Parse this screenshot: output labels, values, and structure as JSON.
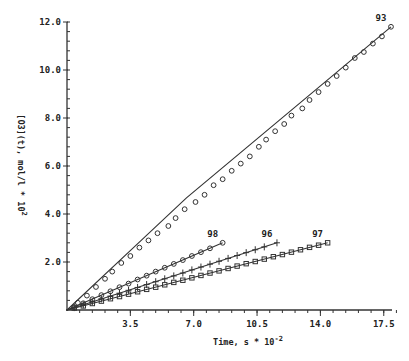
{
  "chart_data": {
    "type": "scatter",
    "title": "",
    "xlabel": "Time, s * 10",
    "xlabel_exponent": "-2",
    "ylabel": "[O3](t), mol/l * 10",
    "ylabel_exponent": "2",
    "xlim": [
      0,
      18.2
    ],
    "ylim": [
      0,
      12.0
    ],
    "x_ticks": [
      3.5,
      7.0,
      10.5,
      14.0,
      17.5
    ],
    "x_tick_labels": [
      "3.5",
      "7.0",
      "10.5",
      "14.0",
      "17.5"
    ],
    "x_minor_step": 0.7,
    "y_ticks": [
      2.0,
      4.0,
      6.0,
      8.0,
      10.0,
      12.0
    ],
    "y_tick_labels": [
      "2.0",
      "4.0",
      "6.0",
      "8.0",
      "10.0",
      "12.0"
    ],
    "y_minor_step": 0.4,
    "grid": false,
    "legend": "none (series labeled inline at line ends)",
    "series": [
      {
        "name": "93",
        "marker": "circle",
        "fit_line": [
          [
            0,
            0
          ],
          [
            4.1,
            2.9
          ],
          [
            6.6,
            4.67
          ],
          [
            17.9,
            11.8
          ]
        ],
        "points": [
          [
            0.6,
            0.3
          ],
          [
            1.1,
            0.6
          ],
          [
            1.6,
            0.96
          ],
          [
            2.1,
            1.3
          ],
          [
            2.5,
            1.6
          ],
          [
            3.0,
            1.96
          ],
          [
            3.5,
            2.25
          ],
          [
            4.0,
            2.6
          ],
          [
            4.5,
            2.9
          ],
          [
            5.0,
            3.2
          ],
          [
            5.6,
            3.5
          ],
          [
            6.0,
            3.83
          ],
          [
            6.5,
            4.2
          ],
          [
            7.1,
            4.5
          ],
          [
            7.6,
            4.8
          ],
          [
            8.1,
            5.2
          ],
          [
            8.6,
            5.45
          ],
          [
            9.1,
            5.8
          ],
          [
            9.6,
            6.1
          ],
          [
            10.1,
            6.4
          ],
          [
            10.6,
            6.8
          ],
          [
            11.0,
            7.1
          ],
          [
            11.5,
            7.45
          ],
          [
            12.0,
            7.75
          ],
          [
            12.4,
            8.1
          ],
          [
            13.0,
            8.4
          ],
          [
            13.4,
            8.75
          ],
          [
            13.9,
            9.08
          ],
          [
            14.4,
            9.42
          ],
          [
            14.9,
            9.75
          ],
          [
            15.4,
            10.1
          ],
          [
            15.9,
            10.5
          ],
          [
            16.4,
            10.75
          ],
          [
            16.9,
            11.1
          ],
          [
            17.4,
            11.4
          ],
          [
            17.9,
            11.8
          ]
        ]
      },
      {
        "name": "98",
        "marker": "circle",
        "fit_line": [
          [
            0,
            0
          ],
          [
            8.6,
            2.8
          ]
        ],
        "points": [
          [
            0.4,
            0.12
          ],
          [
            0.9,
            0.28
          ],
          [
            1.4,
            0.45
          ],
          [
            1.9,
            0.62
          ],
          [
            2.4,
            0.78
          ],
          [
            2.9,
            0.95
          ],
          [
            3.4,
            1.1
          ],
          [
            3.9,
            1.27
          ],
          [
            4.4,
            1.43
          ],
          [
            4.9,
            1.6
          ],
          [
            5.4,
            1.76
          ],
          [
            5.9,
            1.92
          ],
          [
            6.4,
            2.08
          ],
          [
            6.9,
            2.25
          ],
          [
            7.4,
            2.41
          ],
          [
            7.9,
            2.57
          ],
          [
            8.6,
            2.8
          ]
        ]
      },
      {
        "name": "96",
        "marker": "cross",
        "fit_line": [
          [
            0,
            0
          ],
          [
            11.6,
            2.8
          ]
        ],
        "points": [
          [
            0.4,
            0.1
          ],
          [
            0.9,
            0.22
          ],
          [
            1.4,
            0.34
          ],
          [
            1.9,
            0.46
          ],
          [
            2.4,
            0.58
          ],
          [
            2.9,
            0.7
          ],
          [
            3.4,
            0.82
          ],
          [
            3.9,
            0.94
          ],
          [
            4.4,
            1.06
          ],
          [
            4.9,
            1.18
          ],
          [
            5.4,
            1.3
          ],
          [
            5.9,
            1.42
          ],
          [
            6.4,
            1.54
          ],
          [
            6.9,
            1.67
          ],
          [
            7.4,
            1.79
          ],
          [
            7.9,
            1.91
          ],
          [
            8.4,
            2.03
          ],
          [
            8.9,
            2.15
          ],
          [
            9.4,
            2.27
          ],
          [
            9.9,
            2.39
          ],
          [
            10.4,
            2.51
          ],
          [
            10.9,
            2.63
          ],
          [
            11.6,
            2.8
          ]
        ]
      },
      {
        "name": "97",
        "marker": "square",
        "fit_line": [
          [
            0,
            0
          ],
          [
            14.4,
            2.8
          ]
        ],
        "points": [
          [
            0.4,
            0.08
          ],
          [
            0.9,
            0.17
          ],
          [
            1.4,
            0.27
          ],
          [
            1.9,
            0.37
          ],
          [
            2.4,
            0.47
          ],
          [
            2.9,
            0.56
          ],
          [
            3.4,
            0.66
          ],
          [
            3.9,
            0.76
          ],
          [
            4.4,
            0.86
          ],
          [
            4.9,
            0.95
          ],
          [
            5.4,
            1.05
          ],
          [
            5.9,
            1.15
          ],
          [
            6.4,
            1.24
          ],
          [
            6.9,
            1.34
          ],
          [
            7.4,
            1.44
          ],
          [
            7.9,
            1.54
          ],
          [
            8.4,
            1.63
          ],
          [
            8.9,
            1.73
          ],
          [
            9.4,
            1.83
          ],
          [
            9.9,
            1.93
          ],
          [
            10.4,
            2.02
          ],
          [
            10.9,
            2.12
          ],
          [
            11.4,
            2.22
          ],
          [
            11.9,
            2.31
          ],
          [
            12.4,
            2.41
          ],
          [
            12.9,
            2.51
          ],
          [
            13.4,
            2.61
          ],
          [
            13.9,
            2.7
          ],
          [
            14.4,
            2.8
          ]
        ]
      }
    ]
  }
}
